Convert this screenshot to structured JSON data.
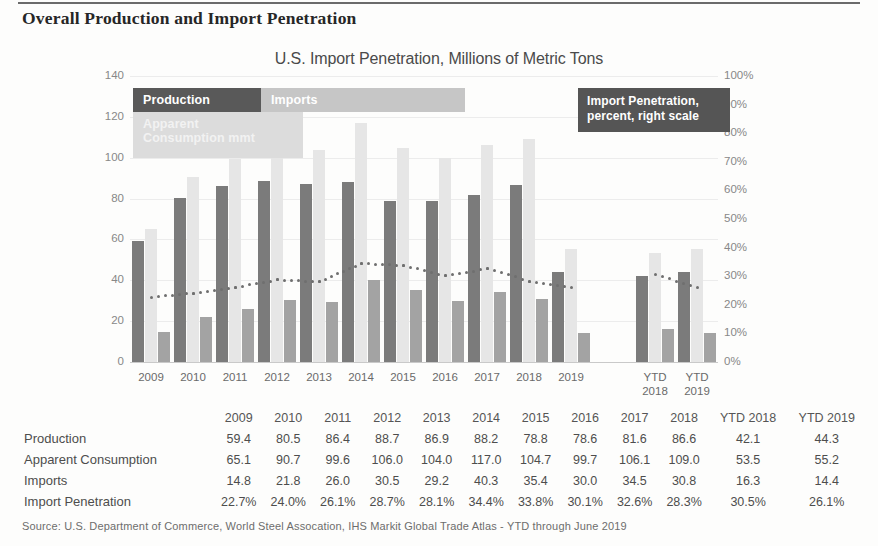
{
  "heading": "Overall Production and Import Penetration",
  "chart_title": "U.S. Import Penetration, Millions of Metric Tons",
  "legend": {
    "production": "Production",
    "imports": "Imports",
    "consumption": "Apparent\nConsumption mmt",
    "penetration": "Import Penetration,\npercent, right scale"
  },
  "source": "Source: U.S. Department of Commerce, World Steel Assocation, IHS Markit Global Trade Atlas -  YTD through June 2019",
  "colors": {
    "production": "#7b7b7b",
    "consumption": "#e6e6e6",
    "imports": "#a3a3a3",
    "penetration": "#6f6f6f",
    "legend_dark": "#595959",
    "legend_light": "#c6c6c6"
  },
  "chart_data": {
    "type": "bar",
    "title": "U.S. Import Penetration, Millions of Metric Tons",
    "xlabel": "",
    "ylabel": "",
    "ylim": [
      0,
      140
    ],
    "y2lim": [
      0,
      100
    ],
    "grid": true,
    "legend_position": "top",
    "categories": [
      "2009",
      "2010",
      "2011",
      "2012",
      "2013",
      "2014",
      "2015",
      "2016",
      "2017",
      "2018",
      "2019",
      "",
      "YTD\n2018",
      "YTD\n2019"
    ],
    "yticks": [
      "0",
      "20",
      "40",
      "60",
      "80",
      "100",
      "120",
      "140"
    ],
    "y2ticks": [
      "0%",
      "10%",
      "20%",
      "30%",
      "40%",
      "50%",
      "60%",
      "70%",
      "80%",
      "90%",
      "100%"
    ],
    "series": [
      {
        "name": "Production",
        "axis": "left",
        "color": "#7b7b7b",
        "values": [
          59.4,
          80.5,
          86.4,
          88.7,
          86.9,
          88.2,
          78.8,
          78.6,
          81.6,
          86.6,
          44.3,
          null,
          42.1,
          44.3
        ]
      },
      {
        "name": "Apparent Consumption mmt",
        "axis": "left",
        "color": "#e6e6e6",
        "values": [
          65.1,
          90.7,
          99.6,
          106.0,
          104.0,
          117.0,
          104.7,
          99.7,
          106.1,
          109.0,
          55.2,
          null,
          53.5,
          55.2
        ]
      },
      {
        "name": "Imports",
        "axis": "left",
        "color": "#a3a3a3",
        "values": [
          14.8,
          21.8,
          26.0,
          30.5,
          29.2,
          40.3,
          35.4,
          30.0,
          34.5,
          30.8,
          14.4,
          null,
          16.3,
          14.4
        ]
      },
      {
        "name": "Import Penetration",
        "axis": "right",
        "type": "line",
        "style": "dotted",
        "color": "#6f6f6f",
        "values": [
          22.7,
          24.0,
          26.1,
          28.7,
          28.1,
          34.4,
          33.8,
          30.1,
          32.6,
          28.3,
          26.1,
          null,
          30.5,
          26.1
        ]
      }
    ]
  },
  "table": {
    "columns": [
      "",
      "2009",
      "2010",
      "2011",
      "2012",
      "2013",
      "2014",
      "2015",
      "2016",
      "2017",
      "2018",
      "YTD 2018",
      "YTD 2019"
    ],
    "rows": [
      {
        "label": "Production",
        "values": [
          "59.4",
          "80.5",
          "86.4",
          "88.7",
          "86.9",
          "88.2",
          "78.8",
          "78.6",
          "81.6",
          "86.6",
          "42.1",
          "44.3"
        ]
      },
      {
        "label": "Apparent Consumption",
        "values": [
          "65.1",
          "90.7",
          "99.6",
          "106.0",
          "104.0",
          "117.0",
          "104.7",
          "99.7",
          "106.1",
          "109.0",
          "53.5",
          "55.2"
        ]
      },
      {
        "label": "Imports",
        "values": [
          "14.8",
          "21.8",
          "26.0",
          "30.5",
          "29.2",
          "40.3",
          "35.4",
          "30.0",
          "34.5",
          "30.8",
          "16.3",
          "14.4"
        ]
      },
      {
        "label": "Import Penetration",
        "values": [
          "22.7%",
          "24.0%",
          "26.1%",
          "28.7%",
          "28.1%",
          "34.4%",
          "33.8%",
          "30.1%",
          "32.6%",
          "28.3%",
          "30.5%",
          "26.1%"
        ]
      }
    ]
  }
}
